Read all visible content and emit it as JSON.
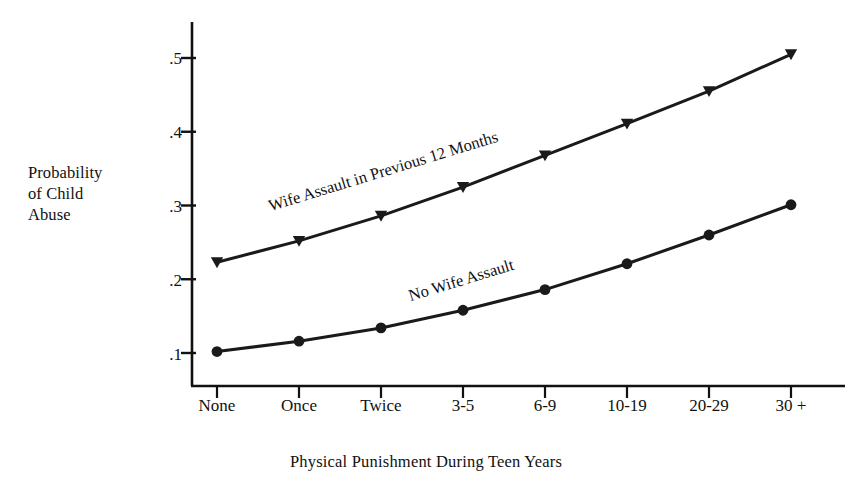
{
  "chart_data": {
    "type": "line",
    "title": "",
    "xlabel": "Physical Punishment During Teen Years",
    "ylabel": "Probability of Child Abuse",
    "ylabel_lines": [
      "Probability",
      "of Child",
      "Abuse"
    ],
    "categories": [
      "None",
      "Once",
      "Twice",
      "3-5",
      "6-9",
      "10-19",
      "20-29",
      "30 +"
    ],
    "ytick_labels": [
      ".1",
      ".2",
      ".3",
      ".4",
      ".5"
    ],
    "ytick_values": [
      0.1,
      0.2,
      0.3,
      0.4,
      0.5
    ],
    "ylim": [
      0.07,
      0.53
    ],
    "grid": false,
    "legend_position": "inline-annotation",
    "series": [
      {
        "name": "Wife Assault in Previous 12 Months",
        "marker": "triangle",
        "color": "#1a1a1a",
        "values": [
          0.223,
          0.252,
          0.286,
          0.325,
          0.368,
          0.411,
          0.455,
          0.505
        ]
      },
      {
        "name": "No Wife Assault",
        "marker": "circle",
        "color": "#1a1a1a",
        "values": [
          0.102,
          0.116,
          0.134,
          0.158,
          0.186,
          0.221,
          0.26,
          0.301
        ]
      }
    ],
    "annotations": [
      {
        "text": "Wife Assault in Previous 12 Months",
        "series": 0
      },
      {
        "text": "No Wife Assault",
        "series": 1
      }
    ]
  },
  "axes": {
    "line_color": "#111111"
  }
}
